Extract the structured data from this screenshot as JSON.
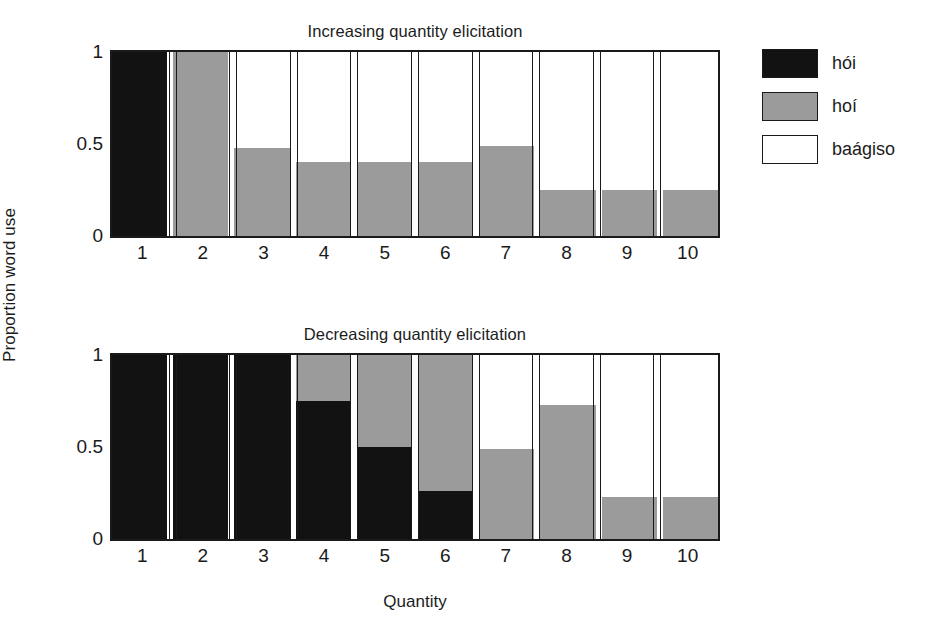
{
  "figure": {
    "ylabel": "Proportion word use",
    "xlabel": "Quantity"
  },
  "legend": {
    "items": [
      {
        "label": "hói",
        "swatch": "black",
        "color": "#121212"
      },
      {
        "label": "hoí",
        "swatch": "gray",
        "color": "#9b9b9b"
      },
      {
        "label": "baágiso",
        "swatch": "white",
        "color": "#ffffff"
      }
    ]
  },
  "panels": [
    {
      "id": "top",
      "title": "Increasing quantity elicitation",
      "yticks": [
        "0",
        "0.5",
        "1"
      ],
      "xticks": [
        "1",
        "2",
        "3",
        "4",
        "5",
        "6",
        "7",
        "8",
        "9",
        "10"
      ]
    },
    {
      "id": "bottom",
      "title": "Decreasing quantity elicitation",
      "yticks": [
        "0",
        "0.5",
        "1"
      ],
      "xticks": [
        "1",
        "2",
        "3",
        "4",
        "5",
        "6",
        "7",
        "8",
        "9",
        "10"
      ]
    }
  ],
  "chart_data": [
    {
      "type": "bar",
      "subtype": "stacked-100",
      "title": "Increasing quantity elicitation",
      "xlabel": "Quantity",
      "ylabel": "Proportion word use",
      "ylim": [
        0,
        1
      ],
      "yticks": [
        0,
        0.5,
        1
      ],
      "grid": false,
      "legend_position": "right",
      "categories": [
        1,
        2,
        3,
        4,
        5,
        6,
        7,
        8,
        9,
        10
      ],
      "series": [
        {
          "name": "hói",
          "color": "#121212",
          "values": [
            1.0,
            0.0,
            0.0,
            0.0,
            0.0,
            0.0,
            0.0,
            0.0,
            0.0,
            0.0
          ]
        },
        {
          "name": "hoí",
          "color": "#9b9b9b",
          "values": [
            0.0,
            1.0,
            0.48,
            0.4,
            0.4,
            0.4,
            0.49,
            0.25,
            0.25,
            0.25
          ]
        },
        {
          "name": "baágiso",
          "color": "#ffffff",
          "values": [
            0.0,
            0.0,
            0.52,
            0.6,
            0.6,
            0.6,
            0.51,
            0.75,
            0.75,
            0.75
          ]
        }
      ]
    },
    {
      "type": "bar",
      "subtype": "stacked-100",
      "title": "Decreasing quantity elicitation",
      "xlabel": "Quantity",
      "ylabel": "Proportion word use",
      "ylim": [
        0,
        1
      ],
      "yticks": [
        0,
        0.5,
        1
      ],
      "grid": false,
      "legend_position": "right",
      "categories": [
        1,
        2,
        3,
        4,
        5,
        6,
        7,
        8,
        9,
        10
      ],
      "series": [
        {
          "name": "hói",
          "color": "#121212",
          "values": [
            1.0,
            1.0,
            1.0,
            0.75,
            0.5,
            0.26,
            0.0,
            0.0,
            0.0,
            0.0
          ]
        },
        {
          "name": "hoí",
          "color": "#9b9b9b",
          "values": [
            0.0,
            0.0,
            0.0,
            0.25,
            0.5,
            0.74,
            0.49,
            0.73,
            0.23,
            0.23
          ]
        },
        {
          "name": "baágiso",
          "color": "#ffffff",
          "values": [
            0.0,
            0.0,
            0.0,
            0.0,
            0.0,
            0.0,
            0.51,
            0.27,
            0.77,
            0.77
          ]
        }
      ]
    }
  ]
}
